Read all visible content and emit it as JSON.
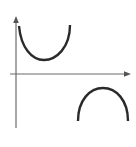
{
  "diagram": {
    "colors": {
      "background": "#ffffff",
      "axis": "#6b6b6b",
      "curve": "#2a2a2a"
    },
    "axes": {
      "x_axis": {
        "label": "",
        "arrow": true
      },
      "y_axis": {
        "label": "",
        "arrow": true
      }
    },
    "curves": [
      {
        "name": "upper-branch",
        "shape": "U (concave up)",
        "position": "above x-axis, near y-axis"
      },
      {
        "name": "lower-branch",
        "shape": "inverted U (concave down)",
        "position": "below x-axis, right side"
      }
    ]
  }
}
